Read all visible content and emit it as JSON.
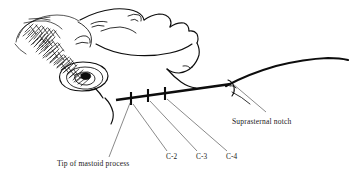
{
  "figure": {
    "background_color": "#ffffff",
    "ink_color": "#0d0d0d",
    "leader_color": "#4a4a4a"
  },
  "labels": {
    "mastoid": {
      "text": "Tip of mastoid process",
      "x": 57,
      "y": 166
    },
    "suprasternal": {
      "text": "Suprasternal notch",
      "x": 232,
      "y": 124
    },
    "vertebrae": [
      {
        "id": "c2",
        "text": "C-2",
        "x": 166,
        "y": 159
      },
      {
        "id": "c3",
        "text": "C-3",
        "x": 196,
        "y": 159
      },
      {
        "id": "c4",
        "text": "C-4",
        "x": 226,
        "y": 159
      }
    ]
  },
  "landmark_line": {
    "name": "mastoid-to-suprasternal-line",
    "start_x": 116,
    "start_y": 100,
    "end_x": 231,
    "end_y": 84
  },
  "tick_marks": [
    {
      "id": "tick-c2",
      "cx": 131,
      "cy": 98
    },
    {
      "id": "tick-c3",
      "cx": 148,
      "cy": 95
    },
    {
      "id": "tick-c4",
      "cx": 165,
      "cy": 93
    }
  ],
  "leaders": [
    {
      "id": "leader-mastoid",
      "x1": 130,
      "y1": 101,
      "x2": 109,
      "y2": 158
    },
    {
      "id": "leader-c2",
      "x1": 133,
      "y1": 102,
      "x2": 167,
      "y2": 152
    },
    {
      "id": "leader-c3",
      "x1": 150,
      "y1": 99,
      "x2": 197,
      "y2": 152
    },
    {
      "id": "leader-c4",
      "x1": 167,
      "y1": 97,
      "x2": 227,
      "y2": 152
    },
    {
      "id": "leader-suprasternal",
      "x1": 233,
      "y1": 84,
      "x2": 266,
      "y2": 112
    }
  ]
}
